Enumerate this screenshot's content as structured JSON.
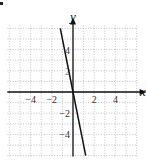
{
  "chart_data": {
    "type": "line",
    "title": "",
    "xlabel": "x",
    "ylabel": "y",
    "xlim": [
      -6,
      6
    ],
    "ylim": [
      -6,
      6
    ],
    "grid": true,
    "grid_style": "dotted",
    "x_ticks": [
      -4,
      -2,
      2,
      4
    ],
    "y_ticks": [
      4,
      2,
      -2,
      -4
    ],
    "x_tick_labels": [
      "−4",
      "−2",
      "2",
      "4"
    ],
    "y_tick_labels": [
      "4",
      "2",
      "−2",
      "−4"
    ],
    "series": [
      {
        "name": "y = -5x",
        "equation": "y = -5x",
        "slope": -5,
        "intercept": 0,
        "points": [
          [
            -1.2,
            6
          ],
          [
            0,
            0
          ],
          [
            1.2,
            -6
          ]
        ]
      }
    ]
  },
  "colors": {
    "axis": "#111111",
    "grid": "#9a9a9a",
    "line": "#111111",
    "background": "#ffffff"
  }
}
